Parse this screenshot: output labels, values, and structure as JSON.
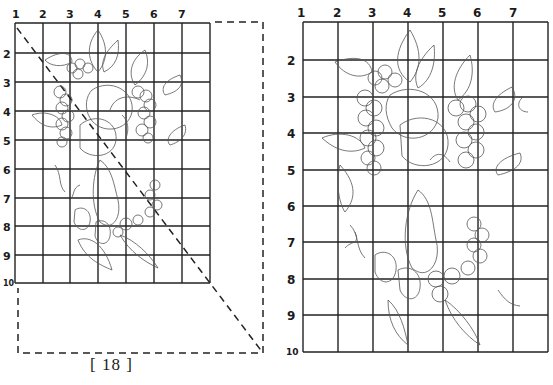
{
  "page": {
    "page_number_label": "[ 18 ]"
  },
  "left_figure": {
    "description": "Small-scale gridded fruit wreath pattern (grapes, apples, pear, strawberries, leaves) with dashed enlargement guide",
    "column_labels": [
      "1",
      "2",
      "3",
      "4",
      "5",
      "6",
      "7"
    ],
    "row_labels": [
      "2",
      "3",
      "4",
      "5",
      "6",
      "7",
      "8",
      "9",
      "10"
    ],
    "grid": {
      "cols": 7,
      "rows": 9
    }
  },
  "right_figure": {
    "description": "Enlarged gridded fruit wreath pattern",
    "column_labels": [
      "1",
      "2",
      "3",
      "4",
      "5",
      "6",
      "7"
    ],
    "row_labels": [
      "2",
      "3",
      "4",
      "5",
      "6",
      "7",
      "8",
      "9",
      "10"
    ],
    "grid": {
      "cols": 7,
      "rows": 9
    }
  }
}
